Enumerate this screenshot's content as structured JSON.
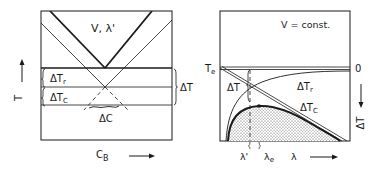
{
  "left_panel": {
    "region_label": "V, λ'",
    "delta_t_r": "ΔT",
    "delta_t_r_sub": "r",
    "delta_t_c": "ΔT",
    "delta_t_c_sub": "C",
    "delta_t": "ΔT",
    "delta_c": "ΔC",
    "y_axis": "T",
    "x_axis": "C",
    "x_axis_sub": "B"
  },
  "right_panel": {
    "condition": "V = const.",
    "te_label": "T",
    "te_sub": "e",
    "zero_label": "0",
    "delta_t": "ΔT",
    "delta_t_r": "ΔT",
    "delta_t_r_sub": "r",
    "delta_t_c": "ΔT",
    "delta_t_c_sub": "C",
    "lambda_prime": "λ'",
    "lambda_e": "λ",
    "lambda_e_sub": "e",
    "x_axis": "λ",
    "y_axis_right": "ΔT"
  },
  "colors": {
    "ink": "#1a1a1a",
    "paper": "#ffffff"
  }
}
